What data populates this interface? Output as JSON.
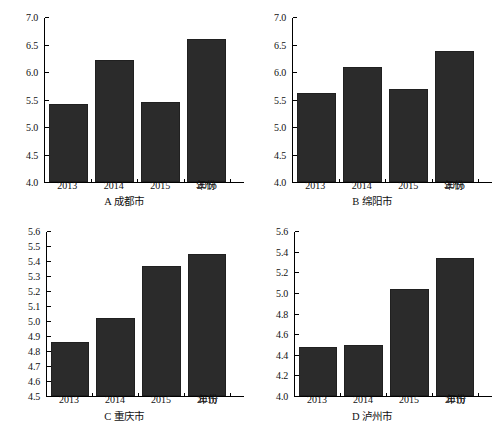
{
  "figure": {
    "background": "#ffffff",
    "bar_color": "#2b2b2b",
    "axis_color": "#000000",
    "x_axis_title": "年份"
  },
  "chart_data": [
    {
      "type": "bar",
      "panel": "A",
      "title": "A 成都市",
      "caption_letter": "A",
      "caption_name": "成都市",
      "categories": [
        "2013",
        "2014",
        "2015",
        "2016"
      ],
      "values": [
        5.43,
        6.23,
        5.46,
        6.61
      ],
      "xlabel": "年份",
      "ylabel": "",
      "ylim": [
        4.0,
        7.0
      ],
      "ytick_step": 0.5,
      "yticks": [
        "4.0",
        "4.5",
        "5.0",
        "5.5",
        "6.0",
        "6.5",
        "7.0"
      ],
      "grid": false,
      "legend": "none"
    },
    {
      "type": "bar",
      "panel": "B",
      "title": "B 绵阳市",
      "caption_letter": "B",
      "caption_name": "绵阳市",
      "categories": [
        "2013",
        "2014",
        "2015",
        "2016"
      ],
      "values": [
        5.62,
        6.1,
        5.7,
        6.4
      ],
      "xlabel": "年份",
      "ylabel": "",
      "ylim": [
        4.0,
        7.0
      ],
      "ytick_step": 0.5,
      "yticks": [
        "4.0",
        "4.5",
        "5.0",
        "5.5",
        "6.0",
        "6.5",
        "7.0"
      ],
      "grid": false,
      "legend": "none"
    },
    {
      "type": "bar",
      "panel": "C",
      "title": "C 重庆市",
      "caption_letter": "C",
      "caption_name": "重庆市",
      "categories": [
        "2013",
        "2014",
        "2015",
        "2016"
      ],
      "values": [
        4.86,
        5.02,
        5.37,
        5.45
      ],
      "xlabel": "年份",
      "ylabel": "",
      "ylim": [
        4.5,
        5.6
      ],
      "ytick_step": 0.1,
      "yticks": [
        "4.5",
        "4.6",
        "4.7",
        "4.8",
        "4.9",
        "5.0",
        "5.1",
        "5.2",
        "5.3",
        "5.4",
        "5.5",
        "5.6"
      ],
      "grid": false,
      "legend": "none"
    },
    {
      "type": "bar",
      "panel": "D",
      "title": "D 泸州市",
      "caption_letter": "D",
      "caption_name": "泸州市",
      "categories": [
        "2013",
        "2014",
        "2015",
        "2016"
      ],
      "values": [
        4.48,
        4.5,
        5.04,
        5.35
      ],
      "xlabel": "年份",
      "ylabel": "",
      "ylim": [
        4.0,
        5.6
      ],
      "ytick_step": 0.2,
      "yticks": [
        "4.0",
        "4.2",
        "4.4",
        "4.6",
        "4.8",
        "5.0",
        "5.2",
        "5.4",
        "5.6"
      ],
      "grid": false,
      "legend": "none"
    }
  ]
}
